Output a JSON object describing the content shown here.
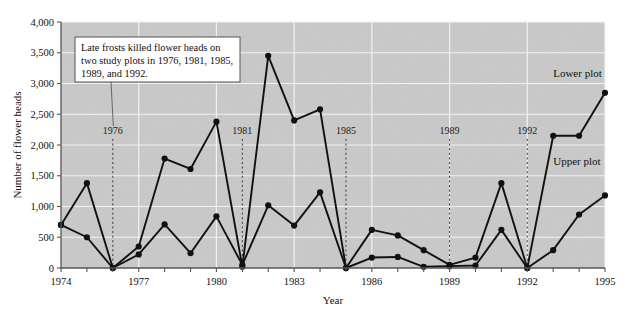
{
  "chart_data": {
    "type": "line",
    "title": "",
    "xlabel": "Year",
    "ylabel": "Number of flower heads",
    "xlim": [
      1974,
      1995
    ],
    "ylim": [
      0,
      4000
    ],
    "ytick_labels": [
      "0",
      "500",
      "1,000",
      "1,500",
      "2,000",
      "2,500",
      "3,000",
      "3,500",
      "4,000"
    ],
    "ytick_values": [
      0,
      500,
      1000,
      1500,
      2000,
      2500,
      3000,
      3500,
      4000
    ],
    "xtick_labels": [
      "1974",
      "1977",
      "1980",
      "1983",
      "1986",
      "1989",
      "1992",
      "1995"
    ],
    "xtick_values": [
      1974,
      1977,
      1980,
      1983,
      1986,
      1989,
      1992,
      1995
    ],
    "x": [
      1974,
      1975,
      1976,
      1977,
      1978,
      1979,
      1980,
      1981,
      1982,
      1983,
      1984,
      1985,
      1986,
      1987,
      1988,
      1989,
      1990,
      1991,
      1992,
      1993,
      1994,
      1995
    ],
    "grid": "white gridlines on gray plot background",
    "legend_position": "inline labels at right of each series",
    "series": [
      {
        "name": "Lower plot",
        "values": [
          700,
          1380,
          0,
          350,
          1780,
          1610,
          2380,
          20,
          3450,
          2400,
          2580,
          0,
          620,
          530,
          290,
          50,
          170,
          1380,
          0,
          2150,
          2150,
          2850
        ],
        "label_x": 1993.0,
        "label_y": 3100
      },
      {
        "name": "Upper plot",
        "values": [
          700,
          500,
          0,
          220,
          710,
          240,
          840,
          50,
          1020,
          690,
          1230,
          0,
          170,
          180,
          20,
          30,
          40,
          620,
          0,
          290,
          870,
          1180
        ],
        "label_x": 1993.0,
        "label_y": 1680
      }
    ],
    "event_markers": [
      {
        "label": "1976",
        "year": 1976
      },
      {
        "label": "1981",
        "year": 1981
      },
      {
        "label": "1985",
        "year": 1985
      },
      {
        "label": "1989",
        "year": 1989
      },
      {
        "label": "1992",
        "year": 1992
      }
    ],
    "annotation": {
      "lines": [
        "Late frosts killed flower heads on",
        "two study plots in 1976, 1981, 1985,",
        "1989, and 1992."
      ],
      "points_to_year": 1976
    },
    "colors": {
      "plot_background": "#c9c9c9",
      "gridline": "#f2f2f2",
      "series_line": "#111111",
      "marker": "#111111",
      "axis": "#555555",
      "event_dash": "#3a3a3a",
      "annotation_background": "#ffffff",
      "annotation_border": "#555555"
    }
  }
}
